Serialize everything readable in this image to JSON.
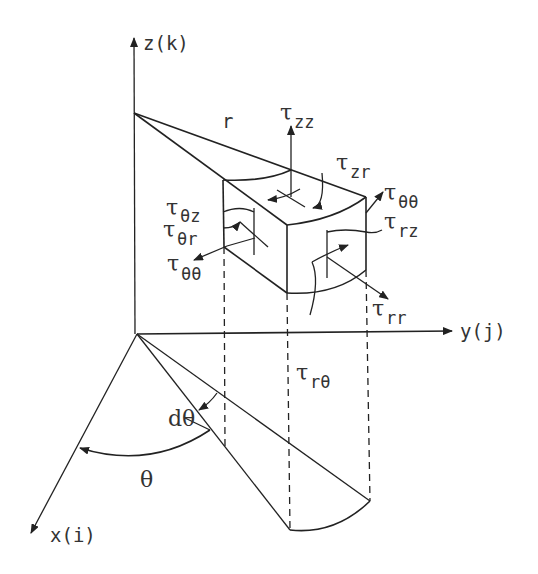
{
  "diagram": {
    "axes": {
      "z_label": "z(k)",
      "y_label": "y(j)",
      "x_label": "x(i)"
    },
    "labels": {
      "r": "r",
      "theta": "θ",
      "dtheta": "dθ"
    },
    "stresses": {
      "tau_zz": {
        "symbol": "τ",
        "sub": "zz"
      },
      "tau_zr": {
        "symbol": "τ",
        "sub": "zr"
      },
      "tau_thth_top": {
        "symbol": "τ",
        "sub": "θθ"
      },
      "tau_rz": {
        "symbol": "τ",
        "sub": "rz"
      },
      "tau_thz": {
        "symbol": "τ",
        "sub": "θz"
      },
      "tau_thr": {
        "symbol": "τ",
        "sub": "θr"
      },
      "tau_thth_left": {
        "symbol": "τ",
        "sub": "θθ"
      },
      "tau_rr": {
        "symbol": "τ",
        "sub": "rr"
      },
      "tau_rth": {
        "symbol": "τ",
        "sub": "rθ"
      }
    }
  }
}
